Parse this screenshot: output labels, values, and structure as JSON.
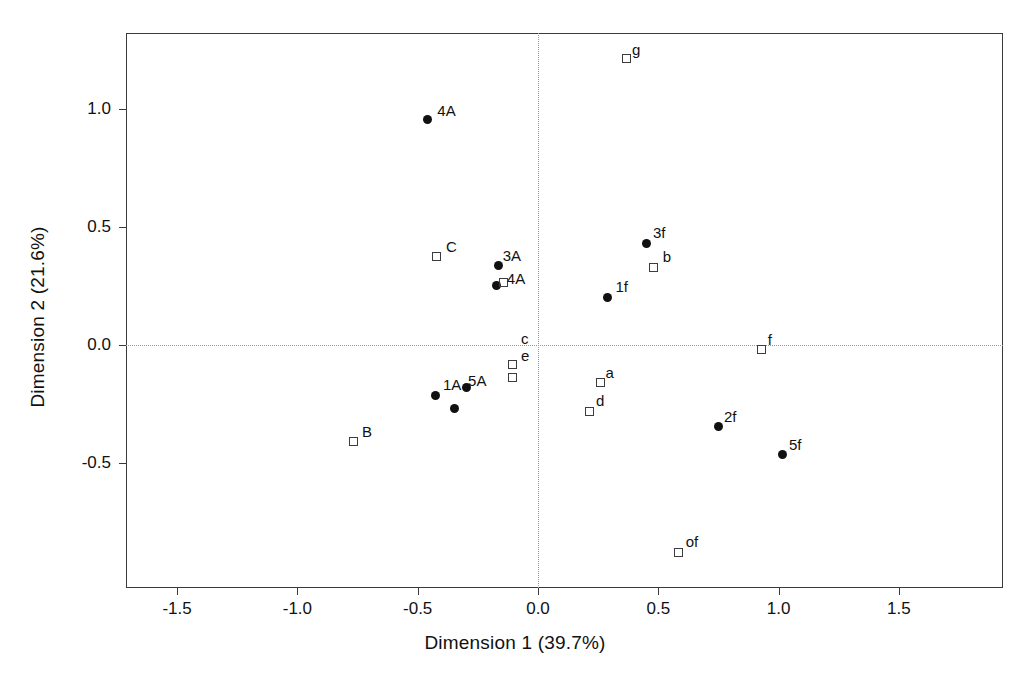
{
  "chart_data": {
    "type": "scatter",
    "title": "",
    "xlabel": "Dimension 1 (39.7%)",
    "ylabel": "Dimension 2 (21.6%)",
    "xlim": [
      -1.72,
      1.94
    ],
    "ylim": [
      -0.98,
      1.32
    ],
    "xticks": [
      -1.5,
      -1.0,
      -0.5,
      0.0,
      0.5,
      1.0,
      1.5
    ],
    "xticklabels": [
      "-1.5",
      "-1.0",
      "-0.5",
      "0.0",
      "0.5",
      "1.0",
      "1.5"
    ],
    "yticks": [
      1.0,
      0.5,
      0.0,
      -0.5
    ],
    "yticklabels": [
      "1.0",
      "0.5",
      "0.0",
      "-0.5"
    ],
    "grid": false,
    "reference_lines": {
      "x": 0.0,
      "y": 0.0,
      "style": "dotted",
      "color": "#9a9a9a"
    },
    "legend": null,
    "marker_colors": {
      "filled": "#111111",
      "open_stroke": "#3c3c3c"
    },
    "series": [
      {
        "name": "row points",
        "marker": "filled-circle",
        "points": [
          {
            "label": "4A",
            "x": -0.46,
            "y": 0.955,
            "label_dx": 10,
            "label_dy": -18
          },
          {
            "label": "3A",
            "x": -0.163,
            "y": 0.335,
            "label_dx": 4,
            "label_dy": -19
          },
          {
            "label": "4A",
            "x": -0.171,
            "y": 0.254,
            "label_dx": 10,
            "label_dy": -15
          },
          {
            "label": "3f",
            "x": 0.449,
            "y": 0.432,
            "label_dx": 7,
            "label_dy": -19
          },
          {
            "label": "1f",
            "x": 0.289,
            "y": 0.202,
            "label_dx": 8,
            "label_dy": -19
          },
          {
            "label": "1A",
            "x": -0.424,
            "y": -0.212,
            "label_dx": 7,
            "label_dy": -19
          },
          {
            "label": "",
            "x": -0.349,
            "y": -0.271,
            "label_dx": 0,
            "label_dy": 0
          },
          {
            "label": "5A",
            "x": -0.299,
            "y": -0.178,
            "label_dx": 2,
            "label_dy": -15
          },
          {
            "label": "2f",
            "x": 0.752,
            "y": -0.347,
            "label_dx": 5,
            "label_dy": -19
          },
          {
            "label": "5f",
            "x": 1.018,
            "y": -0.466,
            "label_dx": 6,
            "label_dy": -19
          }
        ]
      },
      {
        "name": "column points",
        "marker": "open-square",
        "points": [
          {
            "label": "g",
            "x": 0.366,
            "y": 1.212,
            "label_dx": 6,
            "label_dy": -18
          },
          {
            "label": "C",
            "x": -0.42,
            "y": 0.373,
            "label_dx": 9,
            "label_dy": -19
          },
          {
            "label": "b",
            "x": 0.481,
            "y": 0.33,
            "label_dx": 9,
            "label_dy": -19
          },
          {
            "label": "",
            "x": -0.143,
            "y": 0.263,
            "label_dx": 0,
            "label_dy": 0
          },
          {
            "label": "f",
            "x": 0.93,
            "y": -0.02,
            "label_dx": 6,
            "label_dy": -19
          },
          {
            "label": "e",
            "x": -0.108,
            "y": -0.081,
            "label_dx": 9,
            "label_dy": -17
          },
          {
            "label": "c",
            "x": -0.108,
            "y": -0.138,
            "label_dx": 9,
            "label_dy": -48
          },
          {
            "label": "a",
            "x": 0.26,
            "y": -0.161,
            "label_dx": 5,
            "label_dy": -19
          },
          {
            "label": "d",
            "x": 0.216,
            "y": -0.28,
            "label_dx": 6,
            "label_dy": -19
          },
          {
            "label": "B",
            "x": -0.765,
            "y": -0.411,
            "label_dx": 8,
            "label_dy": -19
          },
          {
            "label": "of",
            "x": 0.585,
            "y": -0.879,
            "label_dx": 7,
            "label_dy": -19
          }
        ]
      }
    ]
  }
}
